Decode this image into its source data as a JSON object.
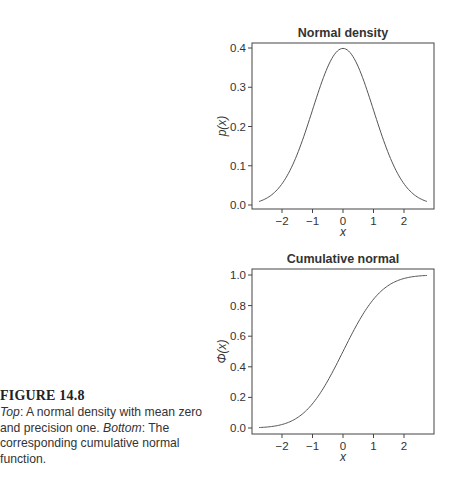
{
  "figure": {
    "label": "FIGURE 14.8",
    "caption_parts": {
      "top_label": "Top",
      "top_text": ": A normal density with mean zero and precision one. ",
      "bottom_label": "Bottom",
      "bottom_text": ": The corresponding cumulative normal function."
    }
  },
  "chart_data": [
    {
      "type": "line",
      "title": "Normal density",
      "xlabel": "x",
      "ylabel": "p(x)",
      "xlim": [
        -2.8,
        2.8
      ],
      "ylim": [
        0.0,
        0.4
      ],
      "x_ticks": [
        "-2",
        "-1",
        "0",
        "1",
        "2"
      ],
      "y_ticks": [
        "0.0",
        "0.1",
        "0.2",
        "0.3",
        "0.4"
      ],
      "grid": false,
      "series": [
        {
          "name": "p(x)",
          "x": [
            -2.75,
            -2.5,
            -2.0,
            -1.5,
            -1.0,
            -0.5,
            0.0,
            0.5,
            1.0,
            1.5,
            2.0,
            2.5,
            2.75
          ],
          "values": [
            0.009,
            0.018,
            0.054,
            0.13,
            0.242,
            0.352,
            0.399,
            0.352,
            0.242,
            0.13,
            0.054,
            0.018,
            0.009
          ]
        }
      ]
    },
    {
      "type": "line",
      "title": "Cumulative normal",
      "xlabel": "x",
      "ylabel": "Φ(x)",
      "xlim": [
        -2.8,
        2.8
      ],
      "ylim": [
        0.0,
        1.0
      ],
      "x_ticks": [
        "-2",
        "-1",
        "0",
        "1",
        "2"
      ],
      "y_ticks": [
        "0.0",
        "0.2",
        "0.4",
        "0.6",
        "0.8",
        "1.0"
      ],
      "grid": false,
      "series": [
        {
          "name": "Φ(x)",
          "x": [
            -2.75,
            -2.5,
            -2.0,
            -1.5,
            -1.0,
            -0.5,
            0.0,
            0.5,
            1.0,
            1.5,
            2.0,
            2.5,
            2.75
          ],
          "values": [
            0.003,
            0.006,
            0.023,
            0.067,
            0.159,
            0.309,
            0.5,
            0.691,
            0.841,
            0.933,
            0.977,
            0.994,
            0.997
          ]
        }
      ]
    }
  ]
}
